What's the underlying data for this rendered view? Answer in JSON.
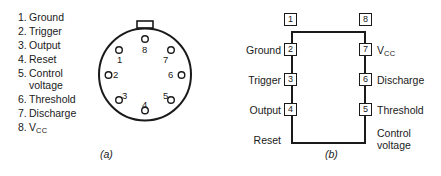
{
  "pin_function_list": {
    "items": [
      {
        "number": "1.",
        "label": "Ground",
        "cont": ""
      },
      {
        "number": "2.",
        "label": "Trigger",
        "cont": ""
      },
      {
        "number": "3.",
        "label": "Output",
        "cont": ""
      },
      {
        "number": "4.",
        "label": "Reset",
        "cont": ""
      },
      {
        "number": "5.",
        "label": "Control",
        "cont": "voltage"
      },
      {
        "number": "6.",
        "label": "Threshold",
        "cont": ""
      },
      {
        "number": "7.",
        "label": "Discharge",
        "cont": ""
      },
      {
        "number": "8.",
        "label": "V",
        "cont": "",
        "subscript": "CC"
      }
    ]
  },
  "panel_a": {
    "caption": "(a)",
    "package_type": "TO-99 metal can",
    "tab_present": true,
    "pins": [
      {
        "number": "8"
      },
      {
        "number": "1"
      },
      {
        "number": "2"
      },
      {
        "number": "3"
      },
      {
        "number": "4"
      },
      {
        "number": "5"
      },
      {
        "number": "6"
      },
      {
        "number": "7"
      }
    ]
  },
  "panel_b": {
    "caption": "(b)",
    "package_type": "8-pin DIP",
    "left_pins": [
      {
        "number": "1",
        "label": "Ground",
        "label2": ""
      },
      {
        "number": "2",
        "label": "Trigger",
        "label2": ""
      },
      {
        "number": "3",
        "label": "Output",
        "label2": ""
      },
      {
        "number": "4",
        "label": "Reset",
        "label2": ""
      }
    ],
    "right_pins": [
      {
        "number": "8",
        "label": "V",
        "label2": "",
        "subscript": "CC"
      },
      {
        "number": "7",
        "label": "Discharge",
        "label2": ""
      },
      {
        "number": "6",
        "label": "Threshold",
        "label2": ""
      },
      {
        "number": "5",
        "label": "Control",
        "label2": "voltage"
      }
    ]
  },
  "colors": {
    "ink": "#1a1a1a",
    "background": "#ffffff"
  }
}
